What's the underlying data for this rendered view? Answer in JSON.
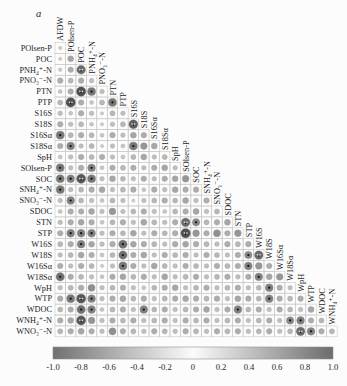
{
  "panel_label": "a",
  "figure": {
    "background": "#fcfcfc",
    "grid_color": "#c6c6c6",
    "label_color": "#1c1c1c",
    "circle_outline": "#9a9a9a"
  },
  "chart_data": {
    "type": "heatmap",
    "subtype": "lower-triangle-correlogram",
    "title": "",
    "panel_label": "a",
    "variables": [
      "AFDW",
      "POlsen-P",
      "POC",
      "PNH₄⁺-N",
      "PNO₃⁻-N",
      "PTN",
      "PTP",
      "S16S",
      "S18S",
      "S16Sα",
      "S18Sα",
      "SpH",
      "SOlsen-P",
      "SOC",
      "SNH₄⁺-N",
      "SNO₃⁻-N",
      "SDOC",
      "STN",
      "STP",
      "W16S",
      "W18S",
      "W16Sα",
      "W18Sα",
      "WpH",
      "WTP",
      "WDOC",
      "WNH₄⁺-N",
      "WNO₃⁻-N"
    ],
    "row_labels": [
      "POlsen-P",
      "POC",
      "PNH₄⁺-N",
      "PNO₃⁻-N",
      "PTN",
      "PTP",
      "S16S",
      "S18S",
      "S16Sα",
      "S18Sα",
      "SpH",
      "SOlsen-P",
      "SOC",
      "SNH₄⁺-N",
      "SNO₃⁻-N",
      "SDOC",
      "STN",
      "STP",
      "W16S",
      "W18S",
      "W16Sα",
      "W18Sα",
      "WpH",
      "WTP",
      "WDOC",
      "WNH₄⁺-N",
      "WNO₃⁻-N"
    ],
    "column_labels": [
      "AFDW",
      "POlsen-P",
      "POC",
      "PNH₄⁺-N",
      "PNO₃⁻-N",
      "PTN",
      "PTP",
      "S16S",
      "S18S",
      "S16Sα",
      "S18Sα",
      "SpH",
      "SOlsen-P",
      "SOC",
      "SNH₄⁺-N",
      "SNO₃⁻-N",
      "SDOC",
      "STN",
      "STP",
      "W16S",
      "W18S",
      "W16Sα",
      "W18Sα",
      "WpH",
      "WTP",
      "WDOC",
      "WNH₄⁺-N"
    ],
    "matrix_lower_triangle": [
      [
        0.1
      ],
      [
        0.1,
        0.35
      ],
      [
        0.12,
        0.3,
        0.75
      ],
      [
        0.3,
        0.25,
        0.3,
        0.2
      ],
      [
        0.15,
        0.3,
        0.9,
        0.65,
        0.2
      ],
      [
        0.25,
        0.9,
        0.3,
        0.15,
        0.25,
        0.65
      ],
      [
        0.2,
        0.15,
        0.3,
        0.2,
        0.1,
        0.25,
        0.2
      ],
      [
        0.3,
        0.2,
        0.25,
        0.15,
        0.1,
        0.2,
        0.25,
        0.8
      ],
      [
        0.65,
        0.25,
        0.3,
        0.25,
        0.15,
        0.3,
        0.2,
        0.35,
        0.3
      ],
      [
        0.3,
        0.6,
        0.2,
        0.25,
        0.1,
        0.2,
        0.15,
        0.65,
        0.45,
        0.35
      ],
      [
        0.15,
        0.2,
        0.3,
        0.25,
        0.3,
        0.2,
        0.15,
        0.25,
        0.35,
        0.2,
        0.25
      ],
      [
        0.65,
        0.2,
        0.3,
        0.6,
        0.15,
        0.3,
        0.25,
        0.3,
        0.2,
        0.3,
        0.35,
        0.2
      ],
      [
        0.65,
        0.6,
        0.85,
        0.65,
        0.2,
        0.35,
        0.25,
        0.2,
        0.3,
        0.2,
        0.3,
        0.35,
        0.45
      ],
      [
        0.65,
        0.2,
        0.25,
        0.3,
        0.35,
        0.2,
        0.25,
        0.3,
        0.15,
        0.3,
        0.2,
        0.35,
        0.3,
        0.3
      ],
      [
        0.2,
        0.6,
        0.25,
        0.2,
        0.15,
        0.25,
        0.2,
        0.1,
        0.2,
        0.25,
        0.3,
        0.25,
        0.35,
        0.2,
        0.3
      ],
      [
        0.15,
        0.3,
        0.3,
        0.35,
        0.2,
        0.45,
        0.2,
        0.25,
        0.3,
        0.2,
        0.15,
        0.25,
        0.3,
        0.35,
        0.2,
        0.25
      ],
      [
        0.2,
        0.3,
        0.35,
        0.3,
        0.15,
        0.25,
        0.3,
        0.2,
        0.35,
        0.25,
        0.2,
        0.3,
        0.75,
        0.55,
        0.25,
        0.3,
        0.35
      ],
      [
        0.3,
        0.6,
        0.6,
        0.6,
        0.2,
        0.3,
        0.25,
        0.35,
        0.2,
        0.3,
        0.25,
        0.3,
        0.9,
        0.45,
        0.3,
        0.5,
        0.3,
        0.45
      ],
      [
        0.25,
        0.3,
        0.6,
        0.35,
        0.2,
        0.3,
        0.7,
        0.35,
        0.3,
        0.25,
        0.2,
        0.3,
        0.35,
        0.3,
        0.25,
        0.2,
        0.3,
        0.25,
        0.3
      ],
      [
        0.2,
        0.25,
        0.35,
        0.3,
        0.15,
        0.25,
        0.7,
        0.3,
        0.35,
        0.2,
        0.3,
        0.25,
        0.3,
        0.2,
        0.3,
        0.25,
        0.2,
        0.3,
        0.55,
        0.75
      ],
      [
        0.3,
        0.2,
        0.3,
        0.25,
        0.1,
        0.2,
        0.65,
        0.3,
        0.2,
        0.35,
        0.25,
        0.2,
        0.3,
        0.25,
        0.2,
        0.3,
        0.25,
        0.3,
        0.6,
        0.45,
        0.3
      ],
      [
        0.7,
        0.3,
        0.25,
        0.2,
        0.15,
        0.3,
        0.35,
        0.25,
        0.3,
        0.2,
        0.35,
        0.2,
        0.25,
        0.3,
        0.2,
        0.25,
        0.3,
        0.2,
        0.3,
        0.6,
        0.35,
        0.45
      ],
      [
        0.2,
        0.25,
        0.3,
        -0.5,
        0.2,
        0.25,
        0.3,
        0.2,
        0.15,
        0.25,
        0.3,
        0.35,
        0.2,
        0.25,
        0.3,
        0.2,
        0.25,
        0.3,
        0.2,
        0.25,
        0.6,
        0.3,
        0.2
      ],
      [
        0.3,
        0.65,
        0.85,
        0.6,
        0.2,
        0.3,
        0.35,
        0.25,
        0.3,
        0.2,
        0.25,
        0.3,
        0.35,
        0.3,
        0.25,
        0.3,
        0.2,
        0.35,
        0.3,
        0.25,
        0.6,
        0.3,
        0.25,
        0.3
      ],
      [
        0.25,
        0.3,
        0.7,
        0.6,
        0.15,
        0.25,
        0.3,
        0.2,
        0.6,
        0.25,
        0.3,
        0.2,
        0.25,
        0.3,
        0.35,
        0.2,
        0.3,
        0.6,
        0.25,
        0.3,
        0.2,
        0.3,
        0.25,
        0.2,
        0.35
      ],
      [
        0.3,
        0.35,
        0.85,
        0.45,
        0.2,
        0.3,
        0.25,
        0.3,
        0.2,
        0.25,
        0.3,
        0.2,
        0.3,
        0.25,
        0.3,
        0.2,
        0.25,
        0.3,
        0.2,
        0.25,
        0.3,
        0.2,
        0.55,
        -0.6,
        0.3,
        0.25
      ],
      [
        0.25,
        0.3,
        0.35,
        0.3,
        0.2,
        0.5,
        0.3,
        0.25,
        0.2,
        0.3,
        0.25,
        0.2,
        0.3,
        0.25,
        0.2,
        0.3,
        0.25,
        0.3,
        0.2,
        0.25,
        0.3,
        0.2,
        0.25,
        -0.75,
        0.6,
        0.3,
        0.25
      ]
    ],
    "legend": {
      "orientation": "horizontal",
      "position": "bottom",
      "min": -1.0,
      "max": 1.0,
      "tick_labels": [
        "-1.0",
        "-0.8",
        "-0.6",
        "-0.4",
        "-0.2",
        "0",
        "0.2",
        "0.4",
        "0.6",
        "0.8",
        "1.0"
      ],
      "colors": {
        "negative_end": "#707070",
        "zero": "#fbfbfb",
        "positive_end": "#6c6c6c"
      }
    }
  }
}
